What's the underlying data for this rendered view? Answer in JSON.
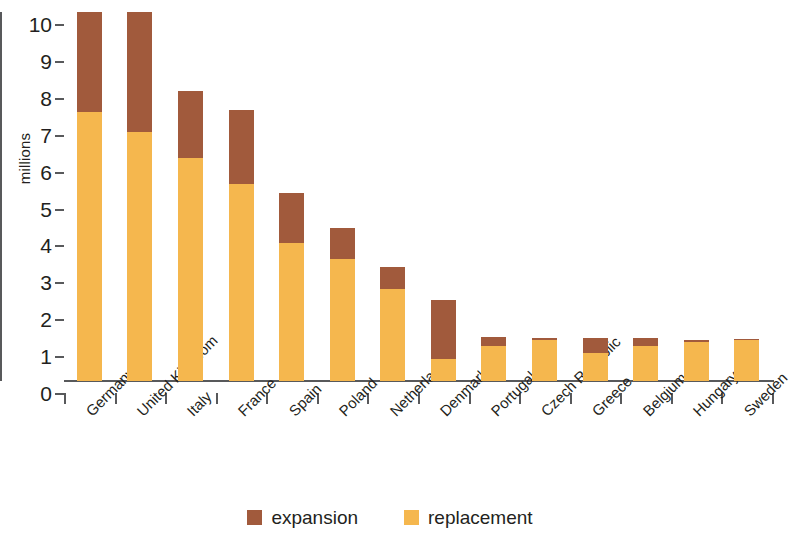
{
  "chart_data": {
    "type": "bar",
    "subtype": "stacked-vertical",
    "title": "",
    "xlabel": "",
    "ylabel": "millions",
    "ylim": [
      0,
      10
    ],
    "yticks": [
      0,
      1,
      2,
      3,
      4,
      5,
      6,
      7,
      8,
      9,
      10
    ],
    "ytick_labels": [
      "0",
      "1",
      "2",
      "3",
      "4",
      "5",
      "6",
      "7",
      "8",
      "9",
      "10"
    ],
    "grid": false,
    "legend_position": "bottom-center",
    "note_clipped": "Germany and United Kingdom bars are clipped at the top of the axis (value 10)",
    "categories": [
      "Germany",
      "United Kingdom",
      "Italy",
      "France",
      "Spain",
      "Poland",
      "Netherlands",
      "Denmark",
      "Portugal",
      "Czech Republic",
      "Greece",
      "Belgium",
      "Hungary",
      "Sweden"
    ],
    "series": [
      {
        "name": "replacement",
        "color": "#f5b74e",
        "values": [
          7.3,
          6.75,
          6.05,
          5.35,
          3.75,
          3.3,
          2.5,
          0.6,
          0.95,
          1.1,
          0.75,
          0.95,
          1.05,
          1.12
        ]
      },
      {
        "name": "expansion",
        "color": "#a15a3c",
        "values": [
          2.7,
          3.25,
          1.8,
          2.0,
          1.35,
          0.85,
          0.6,
          1.6,
          0.25,
          0.07,
          0.42,
          0.22,
          0.05,
          0.02
        ]
      }
    ],
    "totals": [
      10.0,
      10.0,
      7.85,
      7.35,
      5.1,
      4.15,
      3.1,
      2.2,
      1.2,
      1.17,
      1.17,
      1.17,
      1.1,
      1.14
    ]
  },
  "legend": {
    "items": [
      {
        "label": "expansion",
        "color": "#a15a3c"
      },
      {
        "label": "replacement",
        "color": "#f5b74e"
      }
    ]
  }
}
